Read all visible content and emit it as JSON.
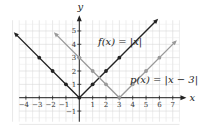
{
  "chart_data": {
    "type": "line",
    "title": "",
    "xlabel": "x",
    "ylabel": "y",
    "xlim": [
      -4.5,
      7.5
    ],
    "ylim": [
      -1.8,
      5.8
    ],
    "grid": true,
    "x_ticks": [
      -4,
      -3,
      -2,
      -1,
      1,
      2,
      3,
      4,
      5,
      6,
      7
    ],
    "y_ticks": [
      -1,
      1,
      2,
      3,
      4,
      5
    ],
    "series": [
      {
        "name": "f(x) = |x|",
        "color": "#222222",
        "points": [
          [
            -4.8,
            4.8
          ],
          [
            0,
            0
          ],
          [
            5.8,
            5.8
          ]
        ],
        "markers": [
          [
            -3,
            3
          ],
          [
            -2,
            2
          ],
          [
            -1,
            1
          ],
          [
            0,
            0
          ],
          [
            1,
            1
          ],
          [
            2,
            2
          ],
          [
            3,
            3
          ]
        ],
        "label_pos": [
          1.4,
          4.2
        ]
      },
      {
        "name": "p(x) = |x − 3|",
        "color": "#9a9a9a",
        "points": [
          [
            -1.8,
            4.8
          ],
          [
            3,
            0
          ],
          [
            7.2,
            4.2
          ]
        ],
        "markers": [
          [
            0,
            3
          ],
          [
            1,
            2
          ],
          [
            2,
            1
          ],
          [
            3,
            0
          ],
          [
            4,
            1
          ],
          [
            5,
            2
          ],
          [
            6,
            3
          ]
        ],
        "label_pos": [
          3.8,
          1.3
        ]
      }
    ]
  },
  "labels": {
    "f": "f(x) = |x|",
    "p": "p(x) = |x − 3|",
    "x_axis": "x",
    "y_axis": "y"
  }
}
